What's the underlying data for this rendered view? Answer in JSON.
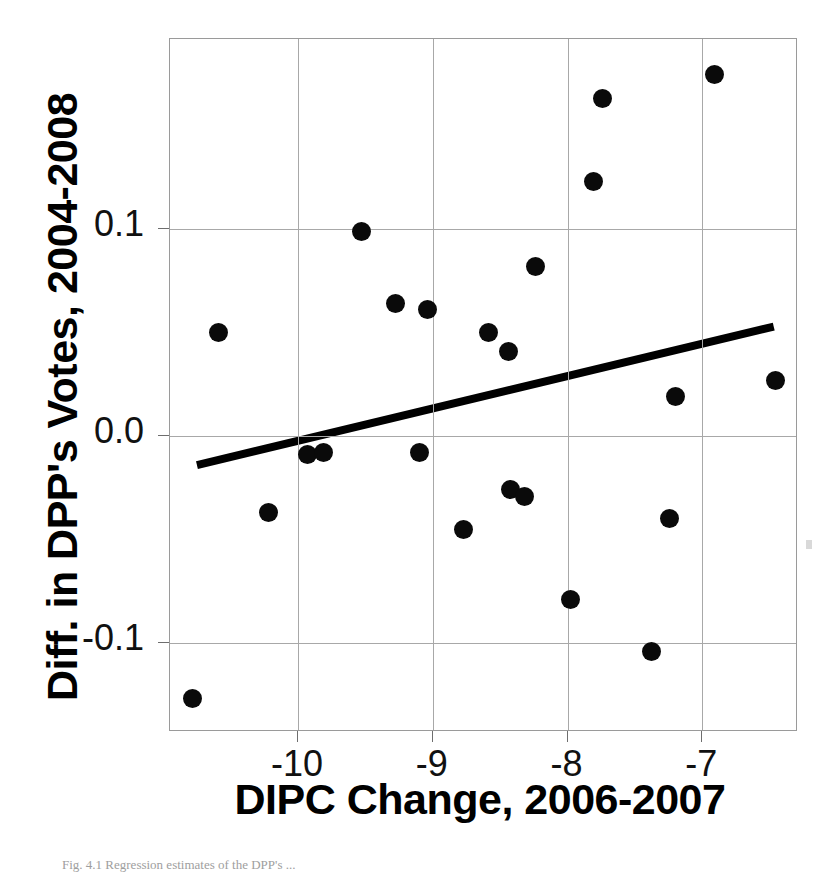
{
  "chart_data": {
    "type": "scatter",
    "title": "",
    "xlabel": "DIPC Change, 2006-2007",
    "ylabel": "Diff. in DPP's Votes, 2004-2008",
    "xlim": [
      -10.95,
      -6.29
    ],
    "ylim": [
      -0.143,
      0.192
    ],
    "xticks": [
      -10,
      -9,
      -8,
      -7
    ],
    "xtick_labels": [
      "-10",
      "-9",
      "-8",
      "-7"
    ],
    "yticks": [
      0.1,
      0.0,
      -0.1
    ],
    "ytick_labels": [
      "0.1",
      "0.0",
      "-0.1"
    ],
    "grid": true,
    "legend": "none",
    "marker_color": "#0a0a0a",
    "trendline_color": "#000000",
    "gridline_color": "#a8a8a8",
    "points": [
      {
        "x": -10.78,
        "y": -0.127
      },
      {
        "x": -10.59,
        "y": 0.05
      },
      {
        "x": -10.22,
        "y": -0.037
      },
      {
        "x": -9.93,
        "y": -0.009
      },
      {
        "x": -9.81,
        "y": -0.008
      },
      {
        "x": -9.53,
        "y": 0.099
      },
      {
        "x": -9.28,
        "y": 0.064
      },
      {
        "x": -9.1,
        "y": -0.008
      },
      {
        "x": -9.04,
        "y": 0.061
      },
      {
        "x": -8.77,
        "y": -0.045
      },
      {
        "x": -8.59,
        "y": 0.05
      },
      {
        "x": -8.44,
        "y": 0.041
      },
      {
        "x": -8.42,
        "y": -0.026
      },
      {
        "x": -8.32,
        "y": -0.029
      },
      {
        "x": -8.24,
        "y": 0.082
      },
      {
        "x": -7.98,
        "y": -0.079
      },
      {
        "x": -7.81,
        "y": 0.123
      },
      {
        "x": -7.74,
        "y": 0.163
      },
      {
        "x": -7.38,
        "y": -0.104
      },
      {
        "x": -7.24,
        "y": -0.04
      },
      {
        "x": -7.2,
        "y": 0.019
      },
      {
        "x": -6.91,
        "y": 0.175
      },
      {
        "x": -6.46,
        "y": 0.027
      }
    ],
    "trendline": {
      "x_start": -10.75,
      "y_start": -0.014,
      "x_end": -6.47,
      "y_end": 0.053
    }
  },
  "caption": {
    "text": "Fig. 4.1  Regression estimates of the DPP's ..."
  }
}
